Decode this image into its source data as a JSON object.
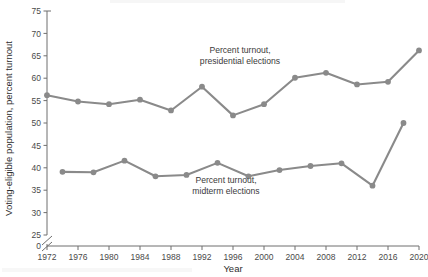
{
  "chart_data": {
    "type": "line",
    "title": "",
    "xlabel": "Year",
    "ylabel": "Voting-eligible population, percent turnout",
    "xlim": [
      1972,
      2020
    ],
    "ylim": [
      25,
      75
    ],
    "y_axis_break": true,
    "y_zero_shown": true,
    "grid": false,
    "legend_position": "inline-annotations",
    "xticks": [
      1972,
      1976,
      1980,
      1984,
      1988,
      1992,
      1996,
      2000,
      2004,
      2008,
      2012,
      2016,
      2020
    ],
    "yticks": [
      0,
      25,
      30,
      35,
      40,
      45,
      50,
      55,
      60,
      65,
      70,
      75
    ],
    "line_color": "#8a8a8a",
    "marker_color": "#8a8a8a",
    "series": [
      {
        "name": "Percent turnout, presidential elections",
        "x": [
          1972,
          1976,
          1980,
          1984,
          1988,
          1992,
          1996,
          2000,
          2004,
          2008,
          2012,
          2016,
          2020
        ],
        "values": [
          56.2,
          54.8,
          54.2,
          55.2,
          52.8,
          58.1,
          51.7,
          54.2,
          60.1,
          61.2,
          58.6,
          59.2,
          66.2
        ]
      },
      {
        "name": "Percent turnout, midterm elections",
        "x": [
          1974,
          1978,
          1982,
          1986,
          1990,
          1994,
          1998,
          2002,
          2006,
          2010,
          2014,
          2018
        ],
        "values": [
          39.1,
          39.0,
          41.6,
          38.1,
          38.4,
          41.1,
          38.1,
          39.5,
          40.4,
          41.0,
          36.0,
          50.0
        ]
      }
    ],
    "annotations": [
      {
        "id": "presidential-label",
        "line1": "Percent turnout,",
        "line2": "presidential elections"
      },
      {
        "id": "midterm-label",
        "line1": "Percent turnout,",
        "line2": "midterm elections"
      }
    ]
  },
  "footnote": ""
}
